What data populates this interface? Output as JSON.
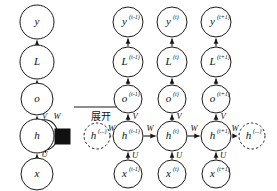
{
  "figure": {
    "type": "rnn-unfolding-computational-graph",
    "background_color": "#ffffff",
    "stroke_color": "#1a1a1a",
    "annotation": "展开"
  },
  "folded_graph": {
    "title": "recurrent (folded) network",
    "nodes": [
      {
        "id": "y",
        "label": "y",
        "sup": "",
        "cx": 37,
        "cy": 22,
        "r": 17,
        "style": "solid"
      },
      {
        "id": "L",
        "label": "L",
        "sup": "",
        "cx": 37,
        "cy": 62,
        "r": 17,
        "style": "solid"
      },
      {
        "id": "o",
        "label": "o",
        "sup": "",
        "cx": 37,
        "cy": 99,
        "r": 16,
        "style": "solid"
      },
      {
        "id": "h",
        "label": "h",
        "sup": "",
        "cx": 37,
        "cy": 136,
        "r": 17,
        "style": "solid"
      },
      {
        "id": "x",
        "label": "x",
        "sup": "",
        "cx": 37,
        "cy": 174,
        "r": 16,
        "style": "solid"
      }
    ],
    "edges": [
      {
        "from": "L",
        "to": "y",
        "label": ""
      },
      {
        "from": "o",
        "to": "L",
        "label": ""
      },
      {
        "from": "h",
        "to": "o",
        "label": "V"
      },
      {
        "from": "x",
        "to": "h",
        "label": "U"
      },
      {
        "from": "h",
        "to": "h",
        "label": "W",
        "kind": "self-loop"
      }
    ],
    "delay_element": {
      "name": "unit-delay-square",
      "x": 55,
      "y": 129,
      "w": 15,
      "h": 15
    }
  },
  "unfold_arrow": {
    "label": "展开",
    "x1": 74,
    "x2": 128,
    "y": 107
  },
  "unfolded_graph": {
    "title": "unfolded through time",
    "time_steps": [
      {
        "index": "t-1",
        "cx": 128,
        "nodes": {
          "y": {
            "label": "y",
            "sup": "(t-1)"
          },
          "L": {
            "label": "L",
            "sup": "(t-1)"
          },
          "o": {
            "label": "o",
            "sup": "(t-1)"
          },
          "h": {
            "label": "h",
            "sup": "(t-1)"
          },
          "x": {
            "label": "x",
            "sup": "(t-1)"
          }
        }
      },
      {
        "index": "t",
        "cx": 172,
        "nodes": {
          "y": {
            "label": "y",
            "sup": "(t)"
          },
          "L": {
            "label": "L",
            "sup": "(t)"
          },
          "o": {
            "label": "o",
            "sup": "(t)"
          },
          "h": {
            "label": "h",
            "sup": "(t)"
          },
          "x": {
            "label": "x",
            "sup": "(t)"
          }
        }
      },
      {
        "index": "t+1",
        "cx": 216,
        "nodes": {
          "y": {
            "label": "y",
            "sup": "(t+1)"
          },
          "L": {
            "label": "L",
            "sup": "(t+1)"
          },
          "o": {
            "label": "o",
            "sup": "(t+1)"
          },
          "h": {
            "label": "h",
            "sup": "(t+1)"
          },
          "x": {
            "label": "x",
            "sup": "(t+1)"
          }
        }
      }
    ],
    "ellipsis_nodes": [
      {
        "id": "h-prev-ellipsis",
        "label": "h",
        "sup": "(...)",
        "cx": 97,
        "cy": 136,
        "r": 13,
        "style": "dashed"
      },
      {
        "id": "h-next-ellipsis",
        "label": "h",
        "sup": "(...)",
        "cx": 252,
        "cy": 136,
        "r": 13,
        "style": "dashed"
      }
    ],
    "row_y": {
      "y": 22,
      "L": 62,
      "o": 99,
      "h": 136,
      "x": 174
    },
    "edge_labels": {
      "output": "V",
      "input": "U",
      "recurrent": "W"
    }
  }
}
